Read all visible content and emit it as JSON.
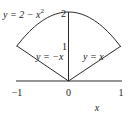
{
  "diagram": {
    "curves": [
      {
        "name": "parabola",
        "equation": "y = 2 − x²",
        "label_main": "y = 2 − x",
        "label_sup": "2"
      },
      {
        "name": "line-neg",
        "equation": "y = −x",
        "label": "y = −x"
      },
      {
        "name": "line-pos",
        "equation": "y = x",
        "label": "y = x"
      }
    ],
    "x_axis": {
      "label": "x",
      "ticks": [
        "−1",
        "0",
        "1"
      ],
      "range": [
        -1,
        1
      ]
    },
    "y_axis": {
      "ticks": [
        "1",
        "2"
      ],
      "range": [
        0,
        2
      ]
    },
    "colors": {
      "stroke": "#2a2a2a",
      "text": "#1a1a1a"
    }
  }
}
